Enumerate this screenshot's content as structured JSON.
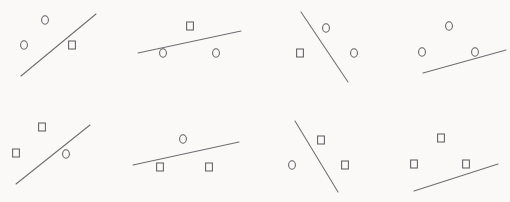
{
  "chart_data": {
    "type": "scatter",
    "title": "",
    "subtitle": "",
    "xlabel": "",
    "ylabel": "",
    "grid": false,
    "legend": "none",
    "axes_visible": false,
    "tick_labels": [],
    "background_color": "#faf9f8",
    "stroke_color": "#6e6e73",
    "marker_color": "#5f5f64",
    "panel_layout": {
      "rows": 2,
      "cols": 4,
      "panel_width": 127.5,
      "panel_height": 101
    },
    "marker_glyphs": {
      "circle": "o",
      "square": "square"
    },
    "xlim": [
      0,
      510
    ],
    "ylim": [
      0,
      202
    ],
    "panels": [
      {
        "id": "panel-1",
        "row": 0,
        "col": 0,
        "line": {
          "x1": 21,
          "y1": 76,
          "x2": 96,
          "y2": 14,
          "slope": "positive"
        },
        "points": [
          {
            "shape": "circle",
            "x": 45,
            "y": 20
          },
          {
            "shape": "circle",
            "x": 24,
            "y": 45
          },
          {
            "shape": "square",
            "x": 72,
            "y": 45
          }
        ]
      },
      {
        "id": "panel-2",
        "row": 0,
        "col": 1,
        "line": {
          "x1": 138,
          "y1": 53,
          "x2": 241,
          "y2": 31,
          "slope": "positive"
        },
        "points": [
          {
            "shape": "square",
            "x": 190,
            "y": 26
          },
          {
            "shape": "circle",
            "x": 163,
            "y": 53
          },
          {
            "shape": "circle",
            "x": 216,
            "y": 53
          }
        ]
      },
      {
        "id": "panel-3",
        "row": 0,
        "col": 2,
        "line": {
          "x1": 301,
          "y1": 12,
          "x2": 348,
          "y2": 82,
          "slope": "negative"
        },
        "points": [
          {
            "shape": "circle",
            "x": 326,
            "y": 28
          },
          {
            "shape": "square",
            "x": 300,
            "y": 53
          },
          {
            "shape": "circle",
            "x": 354,
            "y": 53
          }
        ]
      },
      {
        "id": "panel-4",
        "row": 0,
        "col": 3,
        "line": {
          "x1": 423,
          "y1": 73,
          "x2": 506,
          "y2": 50,
          "slope": "positive"
        },
        "points": [
          {
            "shape": "circle",
            "x": 449,
            "y": 26
          },
          {
            "shape": "circle",
            "x": 422,
            "y": 52
          },
          {
            "shape": "circle",
            "x": 475,
            "y": 52
          }
        ]
      },
      {
        "id": "panel-5",
        "row": 1,
        "col": 0,
        "line": {
          "x1": 16,
          "y1": 184,
          "x2": 90,
          "y2": 125,
          "slope": "positive"
        },
        "points": [
          {
            "shape": "square",
            "x": 42,
            "y": 127
          },
          {
            "shape": "square",
            "x": 16,
            "y": 153
          },
          {
            "shape": "circle",
            "x": 66,
            "y": 154
          }
        ]
      },
      {
        "id": "panel-6",
        "row": 1,
        "col": 1,
        "line": {
          "x1": 133,
          "y1": 165,
          "x2": 239,
          "y2": 142,
          "slope": "positive"
        },
        "points": [
          {
            "shape": "circle",
            "x": 183,
            "y": 139
          },
          {
            "shape": "square",
            "x": 160,
            "y": 167
          },
          {
            "shape": "square",
            "x": 209,
            "y": 167
          }
        ]
      },
      {
        "id": "panel-7",
        "row": 1,
        "col": 2,
        "line": {
          "x1": 295,
          "y1": 121,
          "x2": 338,
          "y2": 192,
          "slope": "negative"
        },
        "points": [
          {
            "shape": "square",
            "x": 321,
            "y": 140
          },
          {
            "shape": "circle",
            "x": 292,
            "y": 165
          },
          {
            "shape": "square",
            "x": 345,
            "y": 165
          }
        ]
      },
      {
        "id": "panel-8",
        "row": 1,
        "col": 3,
        "line": {
          "x1": 414,
          "y1": 191,
          "x2": 498,
          "y2": 164,
          "slope": "positive"
        },
        "points": [
          {
            "shape": "square",
            "x": 441,
            "y": 138
          },
          {
            "shape": "square",
            "x": 414,
            "y": 164
          },
          {
            "shape": "square",
            "x": 466,
            "y": 164
          }
        ]
      }
    ]
  }
}
